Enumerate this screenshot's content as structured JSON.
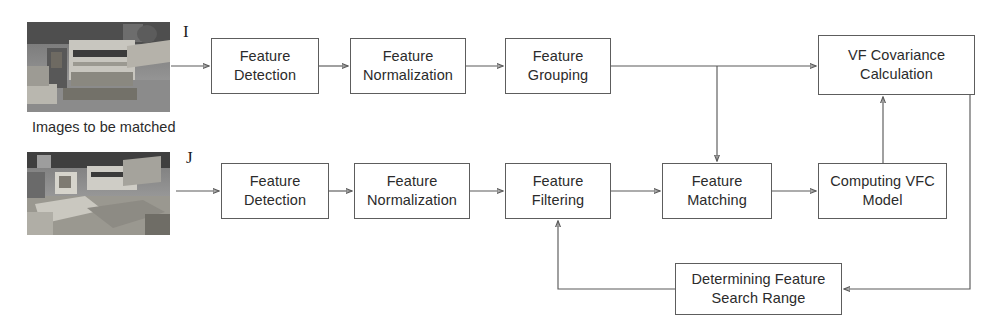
{
  "diagram": {
    "caption": "Images to be matched",
    "input_labels": {
      "top": "I",
      "bottom": "J"
    },
    "colors": {
      "stroke": "#5a5a5a",
      "box_border": "#5d5d5d",
      "text": "#2b2b2b",
      "background": "#ffffff"
    },
    "nodes": [
      {
        "id": "feature-detection-i",
        "label": "Feature\nDetection",
        "x": 211,
        "y": 38,
        "w": 108,
        "h": 56
      },
      {
        "id": "feature-normalization-i",
        "label": "Feature\nNormalization",
        "x": 350,
        "y": 38,
        "w": 116,
        "h": 56
      },
      {
        "id": "feature-grouping",
        "label": "Feature\nGrouping",
        "x": 505,
        "y": 38,
        "w": 106,
        "h": 56
      },
      {
        "id": "vf-covariance",
        "label": "VF Covariance\nCalculation",
        "x": 818,
        "y": 35,
        "w": 157,
        "h": 60
      },
      {
        "id": "feature-detection-j",
        "label": "Feature\nDetection",
        "x": 221,
        "y": 163,
        "w": 108,
        "h": 56
      },
      {
        "id": "feature-normalization-j",
        "label": "Feature\nNormalization",
        "x": 354,
        "y": 163,
        "w": 116,
        "h": 56
      },
      {
        "id": "feature-filtering",
        "label": "Feature\nFiltering",
        "x": 505,
        "y": 163,
        "w": 106,
        "h": 56
      },
      {
        "id": "feature-matching",
        "label": "Feature\nMatching",
        "x": 662,
        "y": 163,
        "w": 110,
        "h": 56
      },
      {
        "id": "computing-vfc-model",
        "label": "Computing VFC\nModel",
        "x": 818,
        "y": 163,
        "w": 129,
        "h": 56
      },
      {
        "id": "determining-search-range",
        "label": "Determining Feature\nSearch Range",
        "x": 675,
        "y": 263,
        "w": 167,
        "h": 52
      }
    ],
    "thumbnails": [
      {
        "id": "image-i-thumbnail",
        "x": 27,
        "y": 22,
        "w": 143,
        "h": 90
      },
      {
        "id": "image-j-thumbnail",
        "x": 27,
        "y": 152,
        "w": 143,
        "h": 83
      }
    ],
    "edges": [
      {
        "id": "edge-image-i-to-detection",
        "from": "image-i-thumbnail",
        "to": "feature-detection-i"
      },
      {
        "id": "edge-detection-i-to-normalization",
        "from": "feature-detection-i",
        "to": "feature-normalization-i"
      },
      {
        "id": "edge-normalization-i-to-grouping",
        "from": "feature-normalization-i",
        "to": "feature-grouping"
      },
      {
        "id": "edge-grouping-to-vf-covariance",
        "from": "feature-grouping",
        "to": "vf-covariance"
      },
      {
        "id": "edge-grouping-to-matching",
        "from": "feature-grouping",
        "to": "feature-matching"
      },
      {
        "id": "edge-image-j-to-detection",
        "from": "image-j-thumbnail",
        "to": "feature-detection-j"
      },
      {
        "id": "edge-detection-j-to-normalization",
        "from": "feature-detection-j",
        "to": "feature-normalization-j"
      },
      {
        "id": "edge-normalization-j-to-filtering",
        "from": "feature-normalization-j",
        "to": "feature-filtering"
      },
      {
        "id": "edge-filtering-to-matching",
        "from": "feature-filtering",
        "to": "feature-matching"
      },
      {
        "id": "edge-matching-to-vfc-model",
        "from": "feature-matching",
        "to": "computing-vfc-model"
      },
      {
        "id": "edge-vfc-model-to-covariance",
        "from": "computing-vfc-model",
        "to": "vf-covariance"
      },
      {
        "id": "edge-covariance-to-search-range",
        "from": "vf-covariance",
        "to": "determining-search-range"
      },
      {
        "id": "edge-search-range-to-filtering",
        "from": "determining-search-range",
        "to": "feature-filtering"
      }
    ]
  }
}
